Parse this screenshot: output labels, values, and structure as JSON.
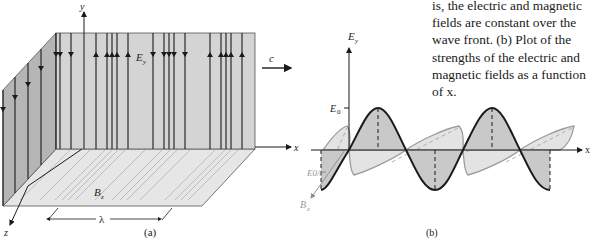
{
  "caption": {
    "lines": [
      "is, the electric and magnetic",
      "fields are constant over the",
      "wave front. (b) Plot of the",
      "strengths of the electric and",
      "magnetic fields as a function",
      "of x."
    ]
  },
  "panel_a": {
    "label": "(a)",
    "axis_y": "y",
    "axis_x": "x",
    "axis_z": "z",
    "field_e": "E",
    "field_e_sub": "y",
    "field_b": "B",
    "field_b_sub": "z",
    "speed_label": "c",
    "wavelength_label": "λ"
  },
  "panel_b": {
    "label": "(b)",
    "axis_y": "E",
    "axis_y_sub": "y",
    "axis_x": "x",
    "amp_e": "E",
    "amp_e_sub": "0",
    "amp_b": "E0/c",
    "axis_b": "B",
    "axis_b_sub": "z"
  },
  "colors": {
    "plane": "#d4d4d4",
    "plane_side": "#b8b8b8",
    "floor": "#e6e6e6",
    "e_fill": "#c9c9c9",
    "b_fill": "#e3e3e3",
    "b_stroke": "#9a9a9a",
    "line": "#1a1a1a"
  }
}
